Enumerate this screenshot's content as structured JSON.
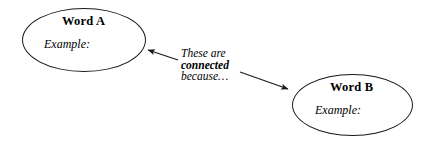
{
  "diagram": {
    "type": "concept-connection-map",
    "background_color": "#ffffff",
    "stroke_color": "#1a1a1a",
    "text_color": "#000000",
    "nodes": [
      {
        "id": "word-a",
        "title": "Word A",
        "example_label": "Example:",
        "shape": "ellipse"
      },
      {
        "id": "word-b",
        "title": "Word B",
        "example_label": "Example:",
        "shape": "ellipse"
      }
    ],
    "connector": {
      "lines": [
        {
          "text": "These are",
          "emphasis": false
        },
        {
          "text": "connected",
          "emphasis": true
        },
        {
          "text": "because…",
          "emphasis": false
        }
      ]
    },
    "arrows": [
      {
        "id": "arrow-to-word-a",
        "direction": "up-left",
        "target": "word-a"
      },
      {
        "id": "arrow-to-word-b",
        "direction": "down-right",
        "target": "word-b"
      }
    ]
  }
}
